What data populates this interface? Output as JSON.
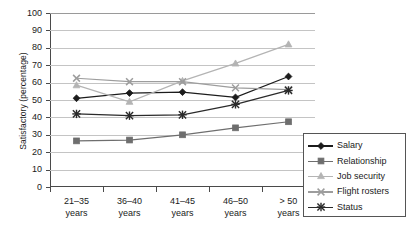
{
  "chart_data": {
    "type": "line",
    "title": "",
    "subtitle": "",
    "xlabel": "",
    "ylabel": "Satisfactory (percentage)",
    "categories": [
      "21–35 years",
      "36–40 years",
      "41–45 years",
      "46–50 years",
      "> 50 years"
    ],
    "category_lines": [
      [
        "21–35",
        "years"
      ],
      [
        "36–40",
        "years"
      ],
      [
        "41–45",
        "years"
      ],
      [
        "46–50",
        "years"
      ],
      [
        "> 50",
        "years"
      ]
    ],
    "ylim": [
      0,
      100
    ],
    "ytick_step": 10,
    "yticks": [
      100,
      90,
      80,
      70,
      60,
      50,
      40,
      30,
      20,
      10,
      0
    ],
    "grid": "horizontal",
    "legend_position": "bottom-right-inside",
    "series": [
      {
        "name": "Salary",
        "marker": "diamond",
        "color": "#1c1c1c",
        "values": [
          51.0,
          54.0,
          54.5,
          51.5,
          63.5
        ]
      },
      {
        "name": "Relationship",
        "marker": "square",
        "color": "#6e6e6e",
        "values": [
          26.5,
          27.0,
          30.0,
          34.0,
          37.5
        ]
      },
      {
        "name": "Job security",
        "marker": "triangle",
        "color": "#b4b4b4",
        "values": [
          58.5,
          49.0,
          61.0,
          71.0,
          82.0
        ]
      },
      {
        "name": "Flight rosters",
        "marker": "x",
        "color": "#9d9d9d",
        "values": [
          62.5,
          60.5,
          60.5,
          57.0,
          56.0
        ]
      },
      {
        "name": "Status",
        "marker": "star",
        "color": "#2a2a2a",
        "values": [
          42.0,
          41.0,
          41.5,
          47.5,
          55.5
        ]
      }
    ]
  },
  "legend": {
    "items": [
      {
        "label": "Salary"
      },
      {
        "label": "Relationship"
      },
      {
        "label": "Job security"
      },
      {
        "label": "Flight rosters"
      },
      {
        "label": "Status"
      }
    ]
  },
  "colors": {
    "axis": "#4a4a4a",
    "grid": "#c4c4c4",
    "background": "#ffffff",
    "text": "#1a1a1a"
  }
}
